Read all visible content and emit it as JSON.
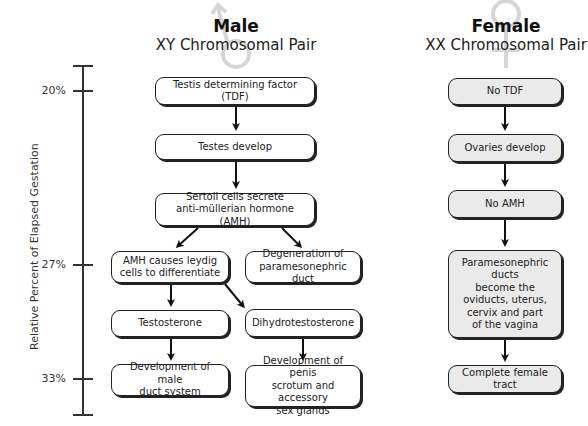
{
  "male": {
    "title": "Male",
    "subtitle": "XY Chromosomal Pair",
    "symbol": "male-symbol",
    "boxes": [
      {
        "id": "tdf",
        "label": "Testis determining factor (TDF)"
      },
      {
        "id": "testes",
        "label": "Testes develop"
      },
      {
        "id": "sertoli",
        "label": "Sertoli cells secrete\nanti-müllerian hormone (AMH)"
      },
      {
        "id": "amh-leydig",
        "label": "AMH causes leydig\ncells to differentiate"
      },
      {
        "id": "degeneration",
        "label": "Degeneration of\nparamesonephric duct"
      },
      {
        "id": "testosterone",
        "label": "Testosterone"
      },
      {
        "id": "dht",
        "label": "Dihydrotestosterone"
      },
      {
        "id": "male-duct",
        "label": "Development of male\nduct system"
      },
      {
        "id": "penis",
        "label": "Development of penis\nscrotum and accessory\nsex glands"
      }
    ]
  },
  "female": {
    "title": "Female",
    "subtitle": "XX Chromosomal Pair",
    "symbol": "female-symbol",
    "boxes": [
      {
        "id": "no-tdf",
        "label": "No TDF"
      },
      {
        "id": "ovaries",
        "label": "Ovaries develop"
      },
      {
        "id": "no-amh",
        "label": "No AMH"
      },
      {
        "id": "paramesonephric",
        "label": "Paramesonephric ducts\nbecome the\noviducts, uterus,\ncervix and part\nof the vagina"
      },
      {
        "id": "complete",
        "label": "Complete female tract"
      }
    ]
  },
  "axis": {
    "label": "Relative Percent of Elapsed Gestation",
    "ticks": [
      {
        "label": "20%"
      },
      {
        "label": "27%"
      },
      {
        "label": "33%"
      }
    ]
  },
  "colors": {
    "stroke": "#222222",
    "female_fill": "#eaeaea",
    "male_fill": "#ffffff",
    "symbol": "#d8d8d8"
  }
}
